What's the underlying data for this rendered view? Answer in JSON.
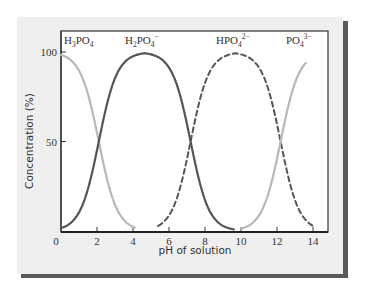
{
  "chart_data": {
    "type": "line",
    "title": "",
    "xlabel": "pH of solution",
    "ylabel": "Concentration (%)",
    "xlim": [
      0,
      14
    ],
    "ylim": [
      0,
      100
    ],
    "x_ticks": [
      0,
      2,
      4,
      6,
      8,
      10,
      12,
      14
    ],
    "x_tick_labels": [
      "0",
      "2",
      "4",
      "6",
      "8",
      "10",
      "12",
      "14"
    ],
    "y_ticks": [
      50,
      100
    ],
    "y_tick_labels": [
      "50",
      "100"
    ],
    "grid": false,
    "legend": "inline-labels-top",
    "series": [
      {
        "name": "H3PO4",
        "label_base": "H",
        "label_sub1": "3",
        "label_mid": "PO",
        "label_sub2": "4",
        "label_sup": "",
        "style": "solid",
        "color": "#b8b8b8",
        "pKa_down": 2.1,
        "x": [
          0,
          0.5,
          1,
          1.5,
          2,
          2.5,
          3,
          3.5,
          4
        ],
        "values": [
          100,
          98,
          90,
          72,
          50,
          27,
          10,
          2,
          0
        ]
      },
      {
        "name": "H2PO4-",
        "label_base": "H",
        "label_sub1": "2",
        "label_mid": "PO",
        "label_sub2": "4",
        "label_sup": "−",
        "style": "solid",
        "color": "#555555",
        "pKa_up": 2.1,
        "pKa_down": 7.2,
        "x": [
          0,
          1,
          2,
          3,
          4,
          5,
          6,
          7,
          8,
          9,
          9.5
        ],
        "values": [
          0,
          10,
          50,
          95,
          100,
          100,
          94,
          55,
          18,
          2,
          0
        ]
      },
      {
        "name": "HPO4 2-",
        "label_base": "HPO",
        "label_sub1": "",
        "label_mid": "",
        "label_sub2": "4",
        "label_sup": "2−",
        "style": "dashed",
        "color": "#555555",
        "pKa_up": 7.2,
        "pKa_down": 12.2,
        "x": [
          5.5,
          6,
          7,
          8,
          9,
          10,
          11,
          12,
          13,
          14
        ],
        "values": [
          0,
          2,
          40,
          96,
          100,
          100,
          95,
          58,
          10,
          0
        ]
      },
      {
        "name": "PO4 3-",
        "label_base": "PO",
        "label_sub1": "",
        "label_mid": "",
        "label_sub2": "4",
        "label_sup": "3−",
        "style": "solid",
        "color": "#b8b8b8",
        "pKa_up": 12.2,
        "x": [
          10,
          11,
          12,
          13,
          13.5
        ],
        "values": [
          0,
          8,
          60,
          97,
          100
        ]
      }
    ]
  }
}
